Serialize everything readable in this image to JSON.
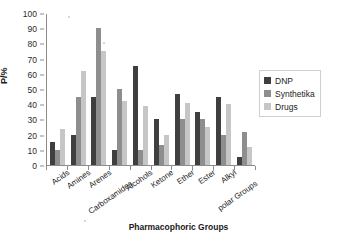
{
  "chart_data": {
    "type": "bar",
    "title": "",
    "xlabel": "Pharmacophoric Groups",
    "ylabel": "P/%",
    "ylim": [
      0,
      100
    ],
    "ytick_step": 10,
    "yticks": [
      0,
      10,
      20,
      30,
      40,
      50,
      60,
      70,
      80,
      90,
      100
    ],
    "grid": false,
    "legend_position": "right",
    "categories": [
      "Acids",
      "Amines",
      "Arenes",
      "Carboxamides",
      "Alcohols",
      "Ketone",
      "Ether",
      "Ester",
      "Alkyl",
      "polar Groups"
    ],
    "series": [
      {
        "name": "DNP",
        "color": "#3f3f3f",
        "values": [
          15,
          20,
          45,
          10,
          65,
          30,
          47,
          35,
          45,
          5
        ]
      },
      {
        "name": "Synthetika",
        "color": "#8e8e8e",
        "values": [
          10,
          45,
          90,
          50,
          10,
          13,
          30,
          30,
          20,
          22
        ]
      },
      {
        "name": "Drugs",
        "color": "#c6c6c6",
        "values": [
          24,
          62,
          75,
          42,
          39,
          20,
          41,
          25,
          40,
          12
        ]
      }
    ]
  },
  "legend": {
    "items": [
      {
        "label": "DNP"
      },
      {
        "label": "Synthetika"
      },
      {
        "label": "Drugs"
      }
    ]
  }
}
